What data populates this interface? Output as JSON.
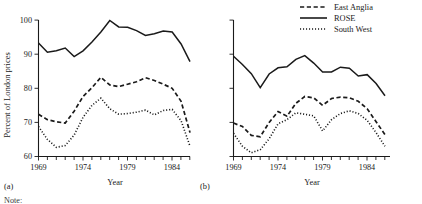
{
  "legend": {
    "position": "top-right",
    "entries": [
      {
        "label": "East Anglia",
        "style": "dashed"
      },
      {
        "label": "ROSE",
        "style": "solid"
      },
      {
        "label": "South West",
        "style": "dotted"
      }
    ]
  },
  "axis": {
    "ylabel": "Percent of London prices",
    "xlabel_a": "Year",
    "xlabel_b": "Year",
    "ytick_labels": [
      "60",
      "70",
      "80",
      "90",
      "100"
    ],
    "xtick_labels": [
      "1969",
      "1974",
      "1979",
      "1984"
    ]
  },
  "panels": {
    "a_tag": "(a)",
    "b_tag": "(b)"
  },
  "note": "Note:",
  "chart_data": [
    {
      "type": "line",
      "panel": "(a)",
      "title": "",
      "xlabel": "Year",
      "ylabel": "Percent of London prices",
      "xlim": [
        1969,
        1986
      ],
      "ylim": [
        60,
        100
      ],
      "grid": false,
      "legend": "top-right",
      "x": [
        1969,
        1970,
        1971,
        1972,
        1973,
        1974,
        1975,
        1976,
        1977,
        1978,
        1979,
        1980,
        1981,
        1982,
        1983,
        1984,
        1985,
        1986
      ],
      "series": [
        {
          "name": "ROSE",
          "style": "solid",
          "values": [
            93.3,
            90.6,
            91.0,
            91.8,
            89.3,
            91.0,
            93.6,
            96.5,
            99.9,
            98.0,
            97.9,
            96.9,
            95.5,
            96.0,
            96.8,
            96.5,
            93.0,
            87.8
          ]
        },
        {
          "name": "East Anglia",
          "style": "dashed",
          "values": [
            72.4,
            70.8,
            70.2,
            69.8,
            73.3,
            77.6,
            80.2,
            83.2,
            81.0,
            80.5,
            81.2,
            81.9,
            83.1,
            82.3,
            81.2,
            80.0,
            76.2,
            67.0
          ]
        },
        {
          "name": "South West",
          "style": "dotted",
          "values": [
            68.8,
            65.0,
            62.7,
            63.2,
            66.3,
            71.5,
            75.0,
            77.1,
            74.0,
            72.4,
            72.6,
            73.0,
            73.6,
            72.2,
            73.5,
            73.8,
            70.5,
            63.0
          ]
        }
      ]
    },
    {
      "type": "line",
      "panel": "(b)",
      "title": "",
      "xlabel": "Year",
      "ylabel": "Percent of London prices",
      "xlim": [
        1969,
        1986
      ],
      "ylim": [
        60,
        100
      ],
      "grid": false,
      "legend": "top-right",
      "x": [
        1969,
        1970,
        1971,
        1972,
        1973,
        1974,
        1975,
        1976,
        1977,
        1978,
        1979,
        1980,
        1981,
        1982,
        1983,
        1984,
        1985,
        1986
      ],
      "series": [
        {
          "name": "ROSE",
          "style": "solid",
          "values": [
            89.4,
            87.0,
            84.3,
            80.2,
            84.2,
            86.0,
            86.3,
            88.5,
            89.6,
            87.4,
            84.8,
            84.8,
            86.2,
            85.9,
            83.6,
            84.0,
            81.4,
            77.8
          ]
        },
        {
          "name": "East Anglia",
          "style": "dashed",
          "values": [
            69.8,
            68.8,
            66.2,
            65.8,
            70.0,
            73.2,
            71.8,
            75.6,
            77.6,
            77.2,
            75.0,
            77.0,
            77.4,
            77.2,
            76.2,
            74.0,
            70.2,
            66.4
          ]
        },
        {
          "name": "South West",
          "style": "dotted",
          "values": [
            66.8,
            63.0,
            61.1,
            62.0,
            65.2,
            69.6,
            70.8,
            72.8,
            72.4,
            71.9,
            67.5,
            70.8,
            72.6,
            73.4,
            72.6,
            70.6,
            67.0,
            63.0
          ]
        }
      ]
    }
  ]
}
